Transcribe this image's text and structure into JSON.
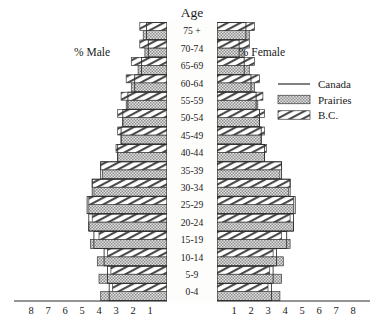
{
  "chart_data": {
    "type": "bar",
    "subtype": "population-pyramid",
    "title": "Age",
    "xlabel": "",
    "ylabel": "Age",
    "left_axis_label": "% Male",
    "right_axis_label": "% Female",
    "axis_unit": "percent",
    "xlim": [
      0,
      8
    ],
    "xticks": [
      1,
      2,
      3,
      4,
      5,
      6,
      7,
      8
    ],
    "xtick_labels_left": [
      "8",
      "7",
      "6",
      "5",
      "4",
      "3",
      "2",
      "1"
    ],
    "xtick_labels_right": [
      "1",
      "2",
      "3",
      "4",
      "5",
      "6",
      "7",
      "8"
    ],
    "grid": false,
    "legend_position": "right",
    "categories": [
      "75 +",
      "70-74",
      "65-69",
      "60-64",
      "55-59",
      "50-54",
      "45-49",
      "40-44",
      "35-39",
      "30-34",
      "25-29",
      "20-24",
      "15-19",
      "10-14",
      "5-9",
      "0-4"
    ],
    "series": [
      {
        "name": "Canada",
        "pattern": "line",
        "male": [
          1.2,
          1.1,
          1.5,
          1.9,
          2.3,
          2.6,
          2.7,
          2.9,
          3.9,
          4.4,
          4.7,
          4.6,
          4.3,
          3.7,
          3.5,
          3.4
        ],
        "female": [
          1.7,
          1.3,
          1.6,
          2.0,
          2.3,
          2.5,
          2.6,
          2.8,
          3.8,
          4.3,
          4.6,
          4.5,
          4.1,
          3.5,
          3.3,
          3.2
        ]
      },
      {
        "name": "Prairies",
        "pattern": "stipple",
        "male": [
          1.4,
          1.3,
          1.7,
          2.1,
          2.4,
          2.6,
          2.7,
          2.9,
          3.8,
          4.3,
          4.6,
          4.6,
          4.5,
          4.1,
          4.0,
          3.9
        ],
        "female": [
          1.9,
          1.6,
          1.9,
          2.2,
          2.4,
          2.5,
          2.6,
          2.8,
          3.7,
          4.2,
          4.5,
          4.5,
          4.3,
          3.9,
          3.8,
          3.7
        ]
      },
      {
        "name": "B.C.",
        "pattern": "hatch",
        "male": [
          1.6,
          1.6,
          2.1,
          2.4,
          2.7,
          2.9,
          2.9,
          3.0,
          3.9,
          4.4,
          4.6,
          4.4,
          4.0,
          3.5,
          3.3,
          3.2
        ],
        "female": [
          2.2,
          1.9,
          2.2,
          2.5,
          2.7,
          2.8,
          2.8,
          2.9,
          3.8,
          4.3,
          4.5,
          4.3,
          3.8,
          3.3,
          3.1,
          3.0
        ]
      }
    ]
  },
  "legend": {
    "items": [
      {
        "label": "Canada",
        "pattern": "line"
      },
      {
        "label": "Prairies",
        "pattern": "stipple"
      },
      {
        "label": "B.C.",
        "pattern": "hatch"
      }
    ]
  }
}
